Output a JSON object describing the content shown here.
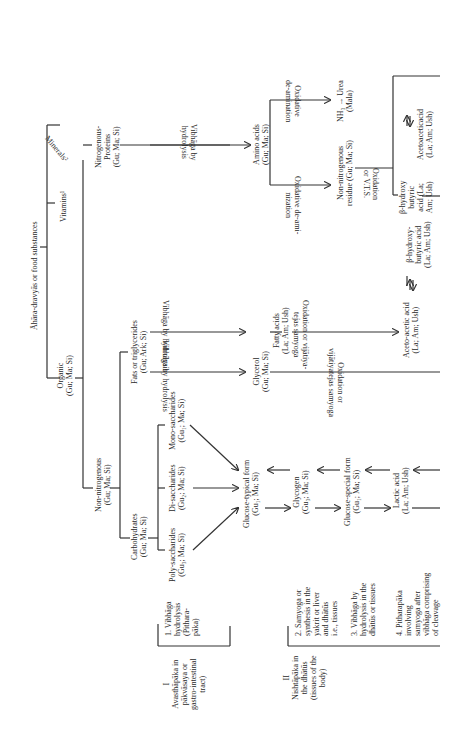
{
  "diagram": {
    "root": "Āhāra-dravyās or food substances",
    "level1": {
      "organic": "Organic\n(Gu; Ma; Si)",
      "vitamins": "Vitamins¹",
      "minerals": "Minerals²"
    },
    "level2": {
      "non_nitrogenous": "Non-nitrogenous\n(Gu; Ma; Si)",
      "nitrogenous": "Nitrogenous-\nProteins\n(Gu; Ma; Si)"
    },
    "level3": {
      "carbohydrates": "Carbohydrates\n(Gu; Ma; Si)",
      "fats": "Fats or triglycerides\n(Gu; Ark; Si)"
    },
    "sugars": {
      "poly": "Poly-saccharides\n(Gu₃; Ma; Si)",
      "di": "Di-saccharides\n(Gu₂; Ma; Si)",
      "mono": "Mono-saccharides\n(Gu₁; Ma; Si)"
    },
    "carb_chain": {
      "glucose_typical": "Glucose-typical form\n(Gu₁; Ma; Si)",
      "glycogen": "Glycogen\n(Gu₃; Ma; Si)",
      "glucose_special": "Glucose-special form\n(Gu₁; Ma; Si)",
      "lactic_acid": "Lactic acid\n(La; Am; Ush)"
    },
    "fat_chain": {
      "hydrolysis_1": "Vibhāga by hydrolysis",
      "hydrolysis_2": "Vibhāga by hydrolysis",
      "glycerol": "Glycerol\n(Gu; Ma; Si)",
      "fatty_acids": "Fatty acids\n(La; Am; Ush)",
      "oxidation_fatty": "Oxidation or vijātiya-\ntejas samyoga",
      "oxidation_glycerol": "Oxidation or\nvijātiyatejas samyoga",
      "aceto_acetic": "Aceto-acetic acid\n(La; Am; Ush)",
      "b_hydroxy_1": "β-hydroxy-\nbutyric acid\n(La; Am; Ush)"
    },
    "protein_chain": {
      "hydrolysis": "Vibhāga by\nhydrolysis",
      "amino_acids": "Amino acids\n(Gu; Ma; Si)",
      "deamination_1": "Oxidative de-ami-\nnization",
      "deamination_2": "Oxidative\nde-amination",
      "non_nitrogenous_residue": "Non-nitrogenous\nresidue (Gu; Ma; Si)",
      "urea": "NH₃ → Urea\n(Mala)",
      "oxidation_vts": "Oxidation\nor V.T.S.",
      "b_hydroxy_2": "β-hydroxy\nbutyric\nacid (La;\nAm; Ush)",
      "acetoacetic": "Acetoaceticacid\n(La; Am; Ush)"
    },
    "stages": {
      "stage1_title": "I\nAvasthāpāka in\npākvāsaya or\ngastro-intestinal\ntract)",
      "stage1_step": "1. Vibhāga\nhydrolysis\n(Pithara-\npāka)",
      "stage2_title": "II\nNishtāpāka in\nthe dhātūs\n(tissues of the\nbody)",
      "step2": "2. Samyoga or\nsynthesis in the\nyakrit or liver\nand dhātūs\ni.e., tissues",
      "step3": "3. Vibhāga by\nhydrolysis in the\ndhātūs or tissues",
      "step4": "4. Pitharapāka\ninvolving\nsamyoga after\nvibhāga comprising\nof cleavage"
    }
  }
}
